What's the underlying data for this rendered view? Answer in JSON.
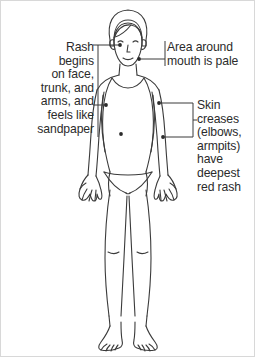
{
  "diagram": {
    "condition_illustrated": "scarlet-fever-rash-distribution",
    "line_color": "#3a3a3a",
    "text_color": "#2b2b2b",
    "border_color": "#d8d8d8",
    "background_color": "#ffffff"
  },
  "callouts": [
    {
      "id": "rash-distribution",
      "text": "Rash\nbegins\non face,\ntrunk, and\narms, and\nfeels like\nsandpaper",
      "align": "right",
      "side": "left",
      "points_to": [
        "face",
        "upper-arm"
      ]
    },
    {
      "id": "pale-mouth-area",
      "text": "Area around\nmouth is pale",
      "align": "left",
      "side": "right",
      "points_to": [
        "perioral-region"
      ]
    },
    {
      "id": "skin-creases",
      "text": "Skin\ncreases\n(elbows,\narmpits)\nhave\ndeepest\nred rash",
      "align": "left",
      "side": "right",
      "points_to": [
        "armpit",
        "elbow"
      ]
    }
  ],
  "markers": [
    {
      "id": "marker-face-cheek",
      "x": 120,
      "y": 45
    },
    {
      "id": "marker-perioral",
      "x": 139,
      "y": 59
    },
    {
      "id": "marker-left-arm",
      "x": 106,
      "y": 105
    },
    {
      "id": "marker-armpit",
      "x": 159,
      "y": 103
    },
    {
      "id": "marker-trunk-left",
      "x": 121,
      "y": 134
    },
    {
      "id": "marker-elbow",
      "x": 163,
      "y": 137
    }
  ]
}
